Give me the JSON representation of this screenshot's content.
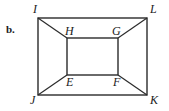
{
  "figure": {
    "part_label": "b.",
    "stroke_color": "#2b2b2b",
    "background_color": "#ffffff",
    "outer_rect": {
      "name": "IJKL",
      "x": 38,
      "y": 18,
      "width": 109,
      "height": 77
    },
    "inner_rect": {
      "name": "EFGH",
      "x": 67,
      "y": 38,
      "width": 51,
      "height": 37
    },
    "vertices": [
      {
        "id": "I",
        "label": "I",
        "x": 38,
        "y": 18,
        "label_x": 33,
        "label_y": 3,
        "position": "outer-top-left"
      },
      {
        "id": "L",
        "label": "L",
        "x": 147,
        "y": 18,
        "label_x": 150,
        "label_y": 3,
        "position": "outer-top-right"
      },
      {
        "id": "J",
        "label": "J",
        "x": 38,
        "y": 95,
        "label_x": 30,
        "label_y": 94,
        "position": "outer-bottom-left"
      },
      {
        "id": "K",
        "label": "K",
        "x": 147,
        "y": 95,
        "label_x": 150,
        "label_y": 94,
        "position": "outer-bottom-right"
      },
      {
        "id": "H",
        "label": "H",
        "x": 67,
        "y": 38,
        "label_x": 65,
        "label_y": 25,
        "position": "inner-top-left"
      },
      {
        "id": "G",
        "label": "G",
        "x": 118,
        "y": 38,
        "label_x": 112,
        "label_y": 25,
        "position": "inner-top-right"
      },
      {
        "id": "E",
        "label": "E",
        "x": 67,
        "y": 75,
        "label_x": 66,
        "label_y": 76,
        "position": "inner-bottom-left"
      },
      {
        "id": "F",
        "label": "F",
        "x": 118,
        "y": 75,
        "label_x": 113,
        "label_y": 76,
        "position": "inner-bottom-right"
      }
    ],
    "edges": [
      {
        "from": "I",
        "to": "L",
        "type": "outer"
      },
      {
        "from": "L",
        "to": "K",
        "type": "outer"
      },
      {
        "from": "K",
        "to": "J",
        "type": "outer"
      },
      {
        "from": "J",
        "to": "I",
        "type": "outer"
      },
      {
        "from": "H",
        "to": "G",
        "type": "inner"
      },
      {
        "from": "G",
        "to": "F",
        "type": "inner"
      },
      {
        "from": "F",
        "to": "E",
        "type": "inner"
      },
      {
        "from": "E",
        "to": "H",
        "type": "inner"
      },
      {
        "from": "I",
        "to": "H",
        "type": "connector"
      },
      {
        "from": "L",
        "to": "G",
        "type": "connector"
      },
      {
        "from": "J",
        "to": "E",
        "type": "connector"
      },
      {
        "from": "K",
        "to": "F",
        "type": "connector"
      }
    ]
  }
}
